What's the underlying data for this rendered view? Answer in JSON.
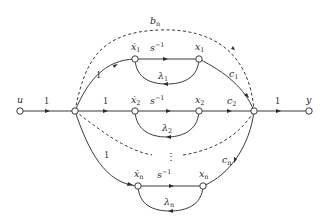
{
  "diagram": {
    "type": "signal-flow-graph",
    "nodes": [
      {
        "id": "u",
        "label": "u"
      },
      {
        "id": "branch",
        "label": ""
      },
      {
        "id": "x1dot",
        "label": "ẋ",
        "sub": "1"
      },
      {
        "id": "x1",
        "label": "x",
        "sub": "1"
      },
      {
        "id": "x2dot",
        "label": "ẋ",
        "sub": "2"
      },
      {
        "id": "x2",
        "label": "x",
        "sub": "2"
      },
      {
        "id": "xndot",
        "label": "ẋ",
        "sub": "n"
      },
      {
        "id": "xn",
        "label": "x",
        "sub": "n"
      },
      {
        "id": "sum",
        "label": ""
      },
      {
        "id": "y",
        "label": "y"
      }
    ],
    "edges": [
      {
        "from": "u",
        "to": "branch",
        "gain": "1"
      },
      {
        "from": "branch",
        "to": "x1dot",
        "gain": "1"
      },
      {
        "from": "branch",
        "to": "x2dot",
        "gain": "1"
      },
      {
        "from": "branch",
        "to": "xndot",
        "gain": "1"
      },
      {
        "from": "x1dot",
        "to": "x1",
        "gain": "s",
        "gain_sup": "−1"
      },
      {
        "from": "x2dot",
        "to": "x2",
        "gain": "s",
        "gain_sup": "−1"
      },
      {
        "from": "xndot",
        "to": "xn",
        "gain": "s",
        "gain_sup": "−1"
      },
      {
        "from": "x1",
        "to": "x1dot",
        "gain": "λ",
        "gain_sub": "1"
      },
      {
        "from": "x2",
        "to": "x2dot",
        "gain": "λ",
        "gain_sub": "2"
      },
      {
        "from": "xn",
        "to": "xndot",
        "gain": "λ",
        "gain_sub": "n"
      },
      {
        "from": "x1",
        "to": "sum",
        "gain": "c",
        "gain_sub": "1"
      },
      {
        "from": "x2",
        "to": "sum",
        "gain": "c",
        "gain_sub": "2"
      },
      {
        "from": "xn",
        "to": "sum",
        "gain": "c",
        "gain_sub": "n"
      },
      {
        "from": "branch",
        "to": "sum",
        "gain": "b",
        "gain_sub": "n",
        "style": "dashed"
      },
      {
        "from": "sum",
        "to": "y",
        "gain": "1"
      }
    ],
    "ellipsis": "⋮",
    "labels": {
      "u": "u",
      "y": "y",
      "one": "1",
      "s": "s",
      "inv": "−1",
      "x": "x",
      "xdot": "ẋ",
      "lambda": "λ",
      "c": "c",
      "b": "b",
      "sub1": "1",
      "sub2": "2",
      "subn": "n"
    }
  }
}
